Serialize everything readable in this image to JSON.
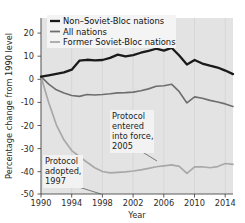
{
  "chart_data": {
    "type": "line",
    "title": "",
    "xlabel": "Year",
    "ylabel": "Percentage change from 1990 level",
    "xlim": [
      1990,
      2015
    ],
    "ylim": [
      -50,
      25
    ],
    "grid": "vertical gridlines at x tick positions",
    "legend_position": "top-left inside plot",
    "xticks": [
      "1990",
      "1994",
      "1998",
      "2002",
      "2006",
      "2010",
      "2014"
    ],
    "xtick_values": [
      1990,
      1994,
      1998,
      2002,
      2006,
      2010,
      2014
    ],
    "yticks": [
      "20",
      "10",
      "0",
      "-10",
      "-20",
      "-30",
      "-40",
      "-50"
    ],
    "ytick_values": [
      20,
      10,
      0,
      -10,
      -20,
      -30,
      -40,
      -50
    ],
    "x": [
      1990,
      1991,
      1992,
      1993,
      1994,
      1995,
      1996,
      1997,
      1998,
      1999,
      2000,
      2001,
      2002,
      2003,
      2004,
      2005,
      2006,
      2007,
      2008,
      2009,
      2010,
      2011,
      2012,
      2013,
      2014,
      2015
    ],
    "series": [
      {
        "name": "Non–Soviet-Bloc nations",
        "color": "#1a1a1a",
        "width": 2.3,
        "values": [
          0.0,
          0.6,
          1.2,
          1.8,
          3.0,
          6.8,
          7.2,
          6.9,
          7.1,
          8.0,
          9.4,
          8.6,
          9.2,
          10.2,
          11.0,
          11.9,
          11.1,
          12.3,
          9.0,
          5.2,
          7.1,
          5.6,
          4.7,
          3.9,
          2.6,
          1.1
        ]
      },
      {
        "name": "All nations",
        "color": "#6e6e6e",
        "width": 1.6,
        "values": [
          0.0,
          -3.2,
          -5.6,
          -7.0,
          -8.0,
          -8.4,
          -7.6,
          -7.8,
          -7.6,
          -7.3,
          -6.9,
          -6.8,
          -6.6,
          -6.0,
          -5.2,
          -4.1,
          -3.9,
          -3.2,
          -6.4,
          -11.2,
          -8.6,
          -9.2,
          -10.1,
          -10.8,
          -11.6,
          -12.7
        ]
      },
      {
        "name": "Former Soviet-Bloc nations",
        "color": "#a8a8a8",
        "width": 1.7,
        "values": [
          0.0,
          -11.0,
          -20.5,
          -27.0,
          -31.5,
          -34.0,
          -36.5,
          -38.8,
          -40.4,
          -41.0,
          -40.8,
          -40.6,
          -40.2,
          -39.7,
          -39.1,
          -38.4,
          -38.0,
          -37.6,
          -38.2,
          -41.2,
          -38.4,
          -38.4,
          -38.8,
          -38.3,
          -37.0,
          -37.4
        ]
      }
    ],
    "annotations": [
      {
        "id": "protocol-adopted",
        "lines": [
          "Protocol",
          "adopted,",
          "1997"
        ],
        "target_year": 1997,
        "target_value": -50
      },
      {
        "id": "protocol-entered-into-force",
        "lines": [
          "Protocol",
          "entered",
          "into force,",
          "2005"
        ],
        "target_year": 2005,
        "target_value": -32
      }
    ]
  }
}
